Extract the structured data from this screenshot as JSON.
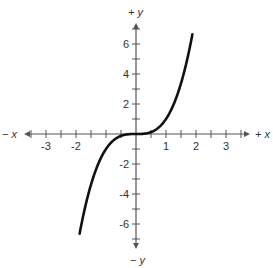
{
  "chart_data": {
    "type": "line",
    "title": "",
    "function": "y = x^3",
    "xlabel_pos": "+ x",
    "xlabel_neg": "− x",
    "ylabel_pos": "+ y",
    "ylabel_neg": "− y",
    "xlim": [
      -3.5,
      3.5
    ],
    "ylim": [
      -7.5,
      7.5
    ],
    "x_tick_step": 0.5,
    "y_tick_step": 1,
    "x_tick_labels": [
      {
        "value": -3,
        "label": "-3"
      },
      {
        "value": -2,
        "label": "-2"
      },
      {
        "value": 1,
        "label": "1"
      },
      {
        "value": 2,
        "label": "2"
      },
      {
        "value": 3,
        "label": "3"
      }
    ],
    "y_tick_labels": [
      {
        "value": 6,
        "label": "6"
      },
      {
        "value": 4,
        "label": "4"
      },
      {
        "value": 2,
        "label": "2"
      },
      {
        "value": -2,
        "label": "-2"
      },
      {
        "value": -4,
        "label": "-4"
      },
      {
        "value": -6,
        "label": "-6"
      }
    ],
    "grid": false,
    "legend": null,
    "series": [
      {
        "name": "y = x^3",
        "x": [
          -1.9,
          -1.75,
          -1.5,
          -1.25,
          -1.0,
          -0.75,
          -0.5,
          -0.25,
          0,
          0.25,
          0.5,
          0.75,
          1.0,
          1.25,
          1.5,
          1.75,
          1.9
        ],
        "y": [
          -6.86,
          -5.36,
          -3.38,
          -1.95,
          -1.0,
          -0.42,
          -0.13,
          -0.02,
          0,
          0.02,
          0.13,
          0.42,
          1.0,
          1.95,
          3.38,
          5.36,
          6.86
        ]
      }
    ],
    "colors": {
      "curve": "#111111",
      "axis": "#555555",
      "text": "#333333"
    }
  }
}
